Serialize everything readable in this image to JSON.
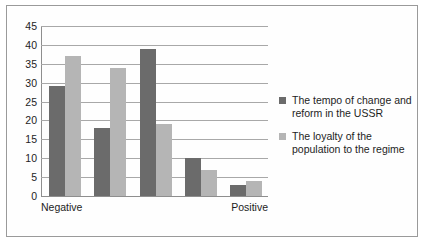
{
  "chart_data": {
    "type": "bar",
    "title": "",
    "subtitle": "",
    "xlabel": "",
    "ylabel": "",
    "ylim": [
      0,
      45
    ],
    "ytick_step": 5,
    "yticks": [
      45,
      40,
      35,
      30,
      25,
      20,
      15,
      10,
      5,
      0
    ],
    "grid": true,
    "legend_position": "right",
    "categories": [
      "1",
      "2",
      "3",
      "4",
      "5"
    ],
    "x_axis_endpoint_labels": {
      "left": "Negative",
      "right": "Positive"
    },
    "series": [
      {
        "name": "The tempo of change and reform in the USSR",
        "color": "#6b6b6b",
        "values": [
          29,
          18,
          39,
          10,
          3
        ]
      },
      {
        "name": "The loyalty of the population to the regime",
        "color": "#b5b5b5",
        "values": [
          37,
          34,
          19,
          7,
          4
        ]
      }
    ]
  },
  "legend": {
    "entries": [
      {
        "label": "The tempo of change and reform in the USSR",
        "color": "#6b6b6b"
      },
      {
        "label": "The loyalty of the population to the regime",
        "color": "#b5b5b5"
      }
    ]
  },
  "axis": {
    "y_labels": [
      "45",
      "40",
      "35",
      "30",
      "25",
      "20",
      "15",
      "10",
      "5",
      "0"
    ],
    "x_labels": [
      "Negative",
      "Positive"
    ]
  }
}
